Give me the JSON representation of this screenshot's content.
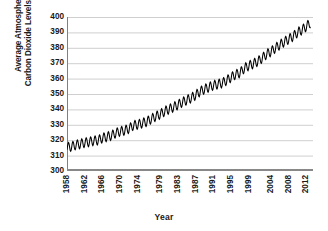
{
  "chart_data": {
    "type": "line",
    "title": "",
    "xlabel": "Year",
    "ylabel": "Average Atmospheric Carbon Dioxide Levels (ppm)",
    "ylabel_line1": "Average Atmospheric",
    "ylabel_line2": "Carbon Dioxide Levels (ppm)",
    "ylim": [
      300,
      400
    ],
    "ytick_labels": [
      "400",
      "390",
      "380",
      "370",
      "360",
      "350",
      "340",
      "330",
      "320",
      "310",
      "300"
    ],
    "ytick_values": [
      400,
      390,
      380,
      370,
      360,
      350,
      340,
      330,
      320,
      310,
      300
    ],
    "xtick_labels": [
      "1958",
      "1962",
      "1966",
      "1970",
      "1974",
      "1979",
      "1983",
      "1987",
      "1991",
      "1995",
      "1999",
      "2004",
      "2008",
      "2012"
    ],
    "xtick_values": [
      1958,
      1962,
      1966,
      1970,
      1974,
      1979,
      1983,
      1987,
      1991,
      1995,
      1999,
      2004,
      2008,
      2012
    ],
    "xlim": [
      1958,
      2013.5
    ],
    "grid": "horizontal",
    "legend": "none",
    "series": [
      {
        "name": "Average Atmospheric Carbon Dioxide Levels (ppm)",
        "color": "#000000",
        "description": "Monthly mean CO2 with seasonal sawtooth oscillation of about 6 ppm peak-to-peak, rising from about 315 ppm in 1958 to about 398 ppm in 2013",
        "seasonal_amplitude_ppm": 6,
        "x": [
          1958,
          1959,
          1960,
          1961,
          1962,
          1963,
          1964,
          1965,
          1966,
          1967,
          1968,
          1969,
          1970,
          1971,
          1972,
          1973,
          1974,
          1975,
          1976,
          1977,
          1978,
          1979,
          1980,
          1981,
          1982,
          1983,
          1984,
          1985,
          1986,
          1987,
          1988,
          1989,
          1990,
          1991,
          1992,
          1993,
          1994,
          1995,
          1996,
          1997,
          1998,
          1999,
          2000,
          2001,
          2002,
          2003,
          2004,
          2005,
          2006,
          2007,
          2008,
          2009,
          2010,
          2011,
          2012,
          2013
        ],
        "values": [
          315.3,
          315.9,
          316.9,
          317.6,
          318.4,
          318.9,
          319.6,
          320.0,
          321.4,
          322.2,
          323.0,
          324.6,
          325.7,
          326.3,
          327.5,
          329.7,
          330.2,
          331.1,
          332.0,
          333.8,
          335.4,
          336.8,
          338.7,
          340.1,
          341.4,
          343.0,
          344.6,
          346.0,
          347.4,
          349.2,
          351.6,
          353.1,
          354.4,
          355.6,
          356.4,
          357.1,
          358.8,
          360.8,
          362.6,
          363.7,
          366.7,
          368.4,
          369.6,
          371.1,
          373.2,
          375.8,
          377.5,
          379.8,
          381.9,
          383.8,
          385.6,
          387.4,
          389.9,
          391.6,
          393.8,
          396.5
        ]
      }
    ]
  },
  "axis": {
    "x_title": "Year"
  }
}
